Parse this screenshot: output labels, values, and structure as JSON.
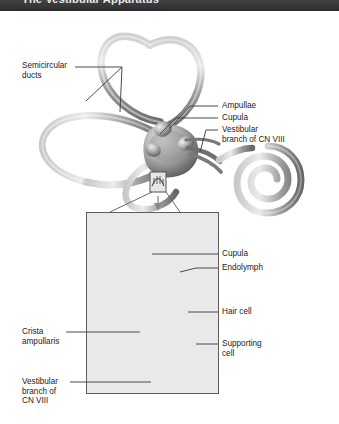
{
  "banner": {
    "title": "The Vestibular Apparatus"
  },
  "figure": {
    "style": "grayscale medical illustration"
  },
  "labels": {
    "semicircular_ducts": "Semicircular\nducts",
    "ampullae": "Ampullae",
    "cupula_upper": "Cupula",
    "vestibular_branch_upper": "Vestibular\nbranch of CN VIII",
    "cupula_panel": "Cupula",
    "endolymph": "Endolymph",
    "hair_cell": "Hair cell",
    "supporting_cell": "Supporting\ncell",
    "crista_ampullaris": "Crista\nampullaris",
    "vestibular_branch_lower": "Vestibular\nbranch of\nCN VIII"
  },
  "colors": {
    "banner_bg": "#3a3a3c",
    "banner_text": "#f2f2f2",
    "label_text": "#1b1b1b",
    "leader_line": "#4a4a4a",
    "panel_border": "#5d5d5d",
    "duct_light": "#d8d8d8",
    "duct_mid": "#9a9a9a",
    "duct_dark": "#5f5f5f",
    "page_bg": "#ffffff"
  }
}
